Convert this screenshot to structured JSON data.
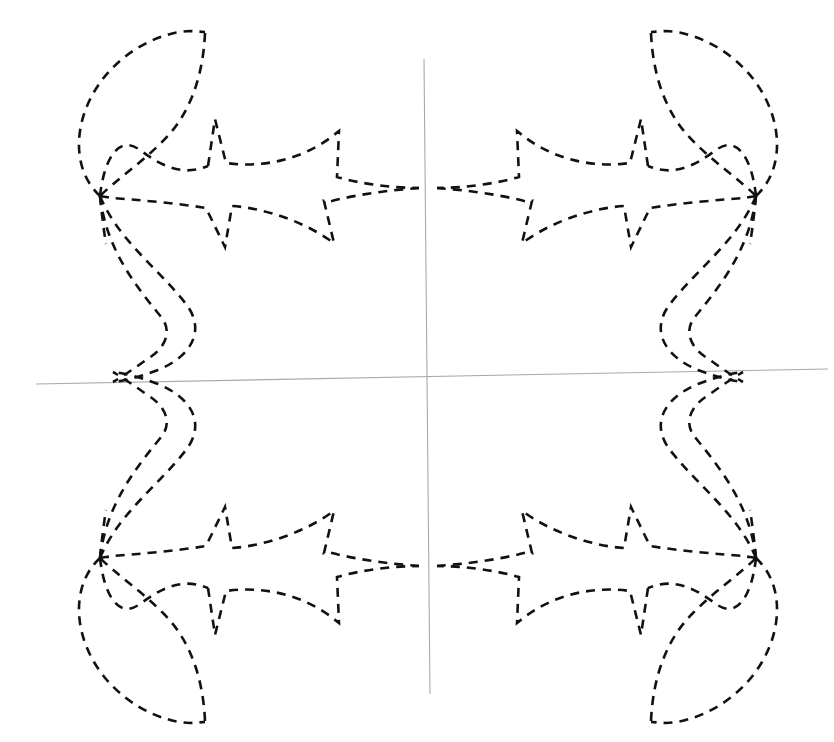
{
  "figure": {
    "title": "",
    "background_color": "#ffffff",
    "width": 834,
    "height": 742
  },
  "axes": {
    "color": "#a9a9a9",
    "stroke_width": 1.1,
    "origin_px": [
      428,
      377
    ],
    "x_axis": {
      "name": "x-axis",
      "from_px": [
        36,
        384
      ],
      "to_px": [
        828,
        369
      ]
    },
    "y_axis": {
      "name": "y-axis",
      "from_px": [
        424,
        59
      ],
      "to_px": [
        430,
        694
      ]
    },
    "ticks": [],
    "tick_labels": [],
    "grid": false,
    "labels": {
      "x": "",
      "y": ""
    }
  },
  "chart_data": {
    "type": "line",
    "title": "",
    "subtitle": "",
    "xlabel": "",
    "ylabel": "",
    "grid": false,
    "legend": [],
    "legend_position": "none",
    "annotations": [],
    "axis_origin_px": [
      428,
      377
    ],
    "symmetry": "4-fold (mirror about both axes)",
    "stroke": {
      "color": "#111111",
      "width": 2.6,
      "style": "dashed",
      "dash_array": "9 7"
    },
    "xlim_px": [
      36,
      828
    ],
    "ylim_px": [
      32,
      734
    ],
    "key_points_px": {
      "outer_node_upper_left": [
        100,
        196
      ],
      "outer_node_upper_right": [
        738,
        185
      ],
      "outer_node_lower_left": [
        104,
        562
      ],
      "outer_node_lower_right": [
        740,
        560
      ],
      "axis_node_left": [
        113,
        382
      ],
      "axis_node_right": [
        745,
        372
      ],
      "center_node_upper": [
        419,
        188
      ],
      "center_node_lower": [
        428,
        562
      ],
      "top_cusp_left": [
        205,
        32
      ],
      "top_cusp_right": [
        651,
        30
      ],
      "bottom_cusp_left": [
        223,
        730
      ],
      "bottom_cusp_right": [
        637,
        722
      ],
      "leftmost_extent": [
        75,
        147
      ],
      "rightmost_extent": [
        781,
        360
      ]
    },
    "series": [
      {
        "name": "outer-petal-upper-left",
        "values_px": [
          [
            100,
            196
          ],
          [
            78,
            150
          ],
          [
            86,
            102
          ],
          [
            130,
            55
          ],
          [
            178,
            34
          ],
          [
            205,
            32
          ]
        ]
      },
      {
        "name": "outer-petal-sweep-upper-left",
        "values_px": [
          [
            205,
            32
          ],
          [
            200,
            86
          ],
          [
            176,
            124
          ],
          [
            138,
            152
          ],
          [
            108,
            176
          ],
          [
            100,
            196
          ]
        ]
      },
      {
        "name": "inner-lobe-upper-left",
        "values_px": [
          [
            100,
            196
          ],
          [
            152,
            177
          ],
          [
            208,
            166
          ],
          [
            216,
            120
          ],
          [
            226,
            164
          ],
          [
            280,
            163
          ],
          [
            336,
            134
          ],
          [
            338,
            176
          ],
          [
            382,
            180
          ],
          [
            419,
            188
          ]
        ]
      },
      {
        "name": "inner-lobe-lower-left",
        "values_px": [
          [
            100,
            196
          ],
          [
            148,
            206
          ],
          [
            205,
            209
          ],
          [
            224,
            246
          ],
          [
            232,
            206
          ],
          [
            288,
            216
          ],
          [
            334,
            241
          ],
          [
            325,
            203
          ],
          [
            372,
            198
          ],
          [
            419,
            188
          ]
        ]
      },
      {
        "name": "descender-left",
        "values_px": [
          [
            100,
            196
          ],
          [
            112,
            256
          ],
          [
            140,
            298
          ],
          [
            170,
            330
          ],
          [
            146,
            356
          ],
          [
            116,
            372
          ],
          [
            113,
            382
          ]
        ]
      },
      {
        "name": "descender-left-outer",
        "values_px": [
          [
            100,
            196
          ],
          [
            140,
            246
          ],
          [
            180,
            296
          ],
          [
            188,
            334
          ],
          [
            160,
            362
          ],
          [
            124,
            378
          ],
          [
            113,
            382
          ]
        ]
      }
    ]
  },
  "elements": {
    "figure_name": "dashed-symmetric-curve-plot",
    "curve_name": "dashed-curve",
    "axis_name": "coordinate-axes"
  }
}
